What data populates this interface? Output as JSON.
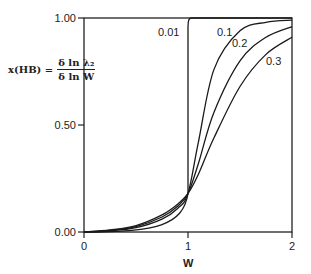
{
  "chart_data": {
    "type": "line",
    "title": "",
    "xlabel": "W",
    "ylabel": "x(HB) = δ ln λ₂ / δ ln W",
    "ylabel_parts": {
      "lhs": "x(HB) =",
      "numerator": "δ ln λ₂",
      "denominator": "δ ln W"
    },
    "xlim": [
      0,
      2
    ],
    "ylim": [
      0,
      1
    ],
    "x_ticks": [
      "0",
      "1",
      "2"
    ],
    "y_ticks": [
      "0.00",
      "0.50",
      "1.00"
    ],
    "grid": false,
    "legend": "inline curve labels",
    "x": [
      0,
      0.25,
      0.5,
      0.75,
      0.9,
      1.0,
      1.1,
      1.25,
      1.5,
      1.75,
      2.0
    ],
    "series": [
      {
        "name": "0.01",
        "values": [
          0.0,
          0.0,
          0.0,
          0.01,
          0.05,
          0.18,
          1.0,
          1.0,
          1.0,
          1.0,
          1.0
        ]
      },
      {
        "name": "0.1",
        "values": [
          0.0,
          0.005,
          0.02,
          0.06,
          0.11,
          0.18,
          0.42,
          0.76,
          0.94,
          0.98,
          0.99
        ]
      },
      {
        "name": "0.2",
        "values": [
          0.0,
          0.008,
          0.025,
          0.07,
          0.12,
          0.18,
          0.32,
          0.56,
          0.8,
          0.91,
          0.96
        ]
      },
      {
        "name": "0.3",
        "values": [
          0.0,
          0.01,
          0.03,
          0.08,
          0.13,
          0.18,
          0.27,
          0.44,
          0.68,
          0.83,
          0.91
        ]
      }
    ],
    "annotations": [
      "0.01",
      "0.1",
      "0.2",
      "0.3"
    ]
  }
}
